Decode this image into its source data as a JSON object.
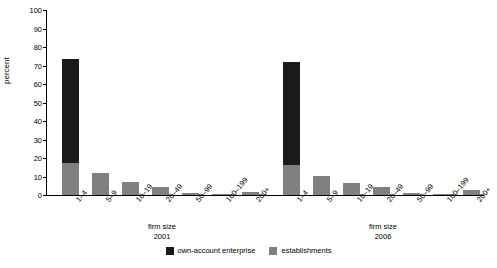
{
  "chart_data": {
    "type": "bar",
    "title": "",
    "xlabel": "firm size",
    "ylabel": "percent",
    "ylim": [
      0,
      100
    ],
    "yticks": [
      0,
      10,
      20,
      30,
      40,
      50,
      60,
      70,
      80,
      90,
      100
    ],
    "grid": false,
    "stacked": true,
    "legend_position": "bottom-center",
    "categories": [
      "1–4",
      "5–9",
      "10–19",
      "20–49",
      "50–99",
      "100–199",
      "200+"
    ],
    "groups": [
      {
        "name": "2001",
        "label": "firm size",
        "year": "2001",
        "series": [
          {
            "name": "own-account enterprise",
            "color": "#1a1a1a",
            "values": [
              73.5,
              0,
              0,
              0,
              0,
              0,
              0
            ]
          },
          {
            "name": "establishments",
            "color": "#808080",
            "values": [
              17.5,
              12.0,
              7.0,
              4.5,
              1.3,
              0.8,
              1.5
            ]
          }
        ]
      },
      {
        "name": "2006",
        "label": "firm size",
        "year": "2006",
        "series": [
          {
            "name": "own-account enterprise",
            "color": "#1a1a1a",
            "values": [
              72.0,
              0,
              0,
              0,
              0,
              0,
              0
            ]
          },
          {
            "name": "establishments",
            "color": "#808080",
            "values": [
              16.0,
              10.5,
              6.5,
              4.5,
              1.2,
              0.8,
              2.5
            ]
          }
        ]
      }
    ],
    "legend": [
      {
        "label": "own-account enterprise",
        "color": "#1a1a1a"
      },
      {
        "label": "establishments",
        "color": "#808080"
      }
    ]
  }
}
